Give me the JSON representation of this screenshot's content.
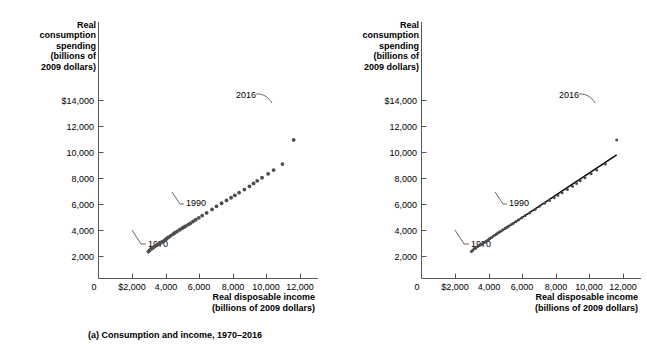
{
  "figure": {
    "background": "#ffffff",
    "ink": "#1a1a1a",
    "marker_color": "#4d4d4d",
    "line_color": "#000000"
  },
  "panels": [
    {
      "id": "a",
      "caption": "(a) Consumption and income, 1970–2016",
      "y_axis_title": "Real\nconsumption\nspending\n(billions of\n2009 dollars)",
      "x_axis_title": "Real disposable income\n(billions of 2009 dollars)",
      "y_ticks": [
        "$14,000",
        "12,000",
        "10,000",
        "8,000",
        "6,000",
        "4,000",
        "2,000",
        "0"
      ],
      "x_ticks": [
        "$2,000",
        "4,000",
        "6,000",
        "8,000",
        "10,000",
        "12,000"
      ],
      "origin_label": "0",
      "annotations": [
        {
          "label": "2016"
        },
        {
          "label": "1990"
        },
        {
          "label": "1970"
        }
      ]
    },
    {
      "id": "b",
      "caption": "(b) The consumption function",
      "y_axis_title": "Real\nconsumption\nspending\n(billions of\n2009 dollars)",
      "x_axis_title": "Real disposable income\n(billions of 2009 dollars)",
      "y_ticks": [
        "$14,000",
        "12,000",
        "10,000",
        "8,000",
        "6,000",
        "4,000",
        "2,000",
        "0"
      ],
      "x_ticks": [
        "$2,000",
        "4,000",
        "6,000",
        "8,000",
        "10,000",
        "12,000"
      ],
      "origin_label": "0",
      "annotations": [
        {
          "label": "2016"
        },
        {
          "label": "1990"
        },
        {
          "label": "1970"
        }
      ]
    }
  ],
  "chart_data": {
    "type": "scatter",
    "xlabel": "Real disposable income (billions of 2009 dollars)",
    "ylabel": "Real consumption spending (billions of 2009 dollars)",
    "xlim": [
      0,
      12800
    ],
    "ylim": [
      0,
      14800
    ],
    "xticks": [
      2000,
      4000,
      6000,
      8000,
      10000,
      12000
    ],
    "yticks": [
      2000,
      4000,
      6000,
      8000,
      10000,
      12000,
      14000
    ],
    "grid": false,
    "legend": null,
    "series": [
      {
        "name": "Consumption vs. disposable income, 1970-2016",
        "x": [
          2935,
          3000,
          3090,
          3164,
          3200,
          3290,
          3400,
          3500,
          3580,
          3630,
          3720,
          3800,
          3880,
          3960,
          4020,
          4120,
          4260,
          4400,
          4500,
          4620,
          4780,
          4920,
          5020,
          5130,
          5280,
          5400,
          5560,
          5720,
          5900,
          6100,
          6360,
          6680,
          6940,
          7240,
          7530,
          7800,
          8020,
          8270,
          8580,
          8880,
          9120,
          9340,
          9620,
          9980,
          10300,
          10820,
          11480
        ],
        "y": [
          2451,
          2545,
          2700,
          2740,
          2795,
          2900,
          3000,
          3080,
          3140,
          3220,
          3300,
          3380,
          3460,
          3560,
          3640,
          3760,
          3900,
          4050,
          4160,
          4280,
          4430,
          4570,
          4670,
          4770,
          4900,
          5020,
          5180,
          5340,
          5520,
          5720,
          5960,
          6280,
          6560,
          6840,
          7100,
          7340,
          7560,
          7800,
          8080,
          8380,
          8640,
          8880,
          9160,
          9520,
          9860,
          10400,
          12600
        ],
        "years": [
          1970,
          1971,
          1972,
          1973,
          1974,
          1975,
          1976,
          1977,
          1978,
          1979,
          1980,
          1981,
          1982,
          1983,
          1984,
          1985,
          1986,
          1987,
          1988,
          1989,
          1990,
          1991,
          1992,
          1993,
          1994,
          1995,
          1996,
          1997,
          1998,
          1999,
          2000,
          2001,
          2002,
          2003,
          2004,
          2005,
          2006,
          2007,
          2008,
          2009,
          2010,
          2011,
          2012,
          2013,
          2014,
          2015,
          2016
        ]
      }
    ],
    "annotations": [
      {
        "label": "1970",
        "note": "first observation, lower-left of cloud"
      },
      {
        "label": "1990",
        "note": "mid-series observation"
      },
      {
        "label": "2016",
        "note": "last observation, upper-right of cloud"
      }
    ],
    "panel_b_note": "Same scatter with a fitted consumption-function line drawn through the points"
  }
}
